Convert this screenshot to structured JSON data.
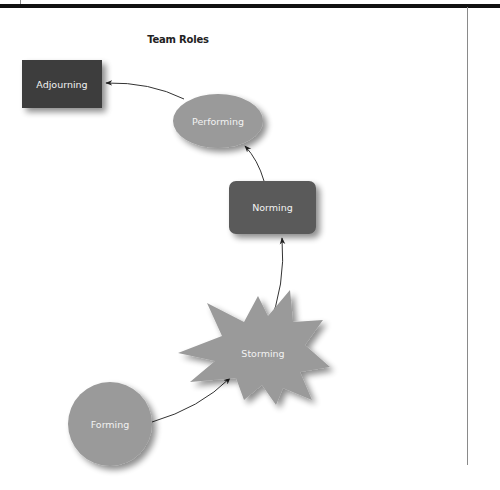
{
  "title": "Team Roles",
  "colors": {
    "top_bar": "#111111",
    "rule": "#8a8a8a",
    "adjourning_fill": "#3d3d3d",
    "norming_fill": "#5a5a5a",
    "light_fill": "#9a9a9a",
    "label_text": "#f2f2f2",
    "arrow": "#333333"
  },
  "nodes": {
    "adjourning": {
      "label": "Adjourning",
      "shape": "square-rectangle"
    },
    "performing": {
      "label": "Performing",
      "shape": "ellipse"
    },
    "norming": {
      "label": "Norming",
      "shape": "rounded-rectangle"
    },
    "storming": {
      "label": "Storming",
      "shape": "starburst"
    },
    "forming": {
      "label": "Forming",
      "shape": "circle"
    }
  },
  "edges": [
    {
      "from": "Forming",
      "to": "Storming"
    },
    {
      "from": "Storming",
      "to": "Norming"
    },
    {
      "from": "Norming",
      "to": "Performing"
    },
    {
      "from": "Performing",
      "to": "Adjourning"
    }
  ]
}
